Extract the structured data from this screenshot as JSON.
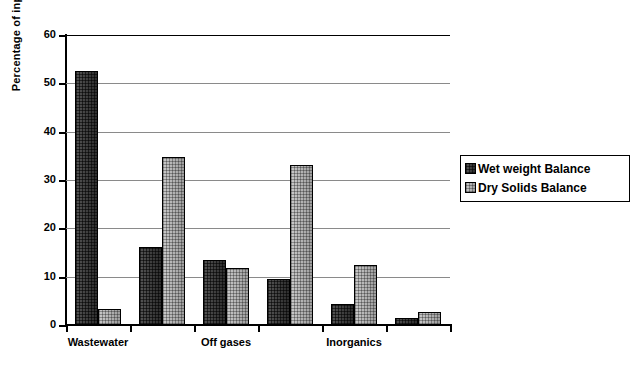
{
  "chart_data": {
    "type": "bar",
    "title": "",
    "xlabel": "",
    "ylabel": "Percentage of input",
    "ylim": [
      0,
      60
    ],
    "yticks": [
      0,
      10,
      20,
      30,
      40,
      50,
      60
    ],
    "grid": "horizontal",
    "legend_position": "right",
    "categories": [
      "Wastewater",
      "",
      "Off gases",
      "",
      "Inorganics",
      ""
    ],
    "visible_category_labels": [
      "Wastewater",
      "Off gases",
      "Inorganics"
    ],
    "group_count": 6,
    "series": [
      {
        "name": "Wet weight Balance",
        "swatch": "#3c3c3c",
        "values": [
          52.5,
          16.2,
          13.5,
          9.5,
          4.4,
          1.5
        ]
      },
      {
        "name": "Dry Solids Balance",
        "swatch": "#b0b0b0",
        "values": [
          3.3,
          34.7,
          11.8,
          33.2,
          12.4,
          2.6
        ]
      }
    ]
  },
  "axis": {
    "y_tick_labels": [
      "60",
      "50",
      "40",
      "30",
      "20",
      "10",
      "0"
    ],
    "y_title": "Percentage of input"
  },
  "legend": {
    "entries": [
      {
        "label": "Wet weight Balance"
      },
      {
        "label": "Dry Solids Balance"
      }
    ]
  }
}
